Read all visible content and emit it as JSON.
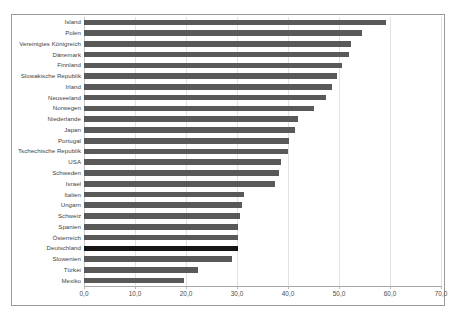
{
  "chart_data": {
    "type": "bar",
    "orientation": "horizontal",
    "title": "",
    "xlabel": "",
    "ylabel": "",
    "xlim": [
      0.0,
      70.0
    ],
    "xticks": [
      "0,0",
      "10,0",
      "20,0",
      "30,0",
      "40,0",
      "50,0",
      "60,0",
      "70,0"
    ],
    "xtick_values": [
      0,
      10,
      20,
      30,
      40,
      50,
      60,
      70
    ],
    "grid": true,
    "legend": "none",
    "categories": [
      "Island",
      "Polen",
      "Vereinigtes Königreich",
      "Dänemark",
      "Finnland",
      "Slowakische Republik",
      "Irland",
      "Neuseeland",
      "Norwegen",
      "Niederlande",
      "Japan",
      "Portugal",
      "Tschechische Republik",
      "USA",
      "Schweden",
      "Israel",
      "Italien",
      "Ungarn",
      "Schweiz",
      "Spanien",
      "Österreich",
      "Deutschland",
      "Slowenien",
      "Türkei",
      "Mexiko"
    ],
    "values": [
      59.3,
      54.6,
      52.3,
      51.9,
      50.5,
      49.7,
      48.7,
      47.5,
      45.0,
      42.0,
      41.3,
      40.1,
      40.0,
      38.7,
      38.3,
      37.5,
      31.4,
      31.0,
      30.6,
      30.2,
      30.1,
      30.1,
      29.1,
      22.4,
      19.7
    ],
    "highlight_category": "Deutschland",
    "colors": {
      "bar": "#595959",
      "bar_highlight": "#141414",
      "gridline": "#e2e2e2",
      "axis": "#a8a8a8",
      "frame": "#9a9a9a",
      "label_text": "#3f3f3f",
      "tick_text": "#4a4a4a",
      "background": "#ffffff"
    }
  }
}
